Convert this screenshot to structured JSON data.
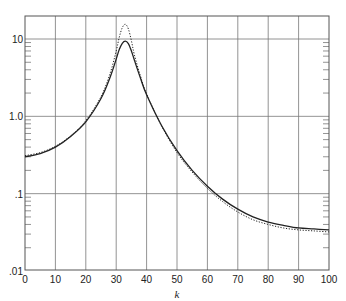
{
  "chart_data": {
    "type": "line",
    "title": "",
    "xlabel": "k",
    "ylabel": "",
    "xlim": [
      0,
      100
    ],
    "ylim": [
      0.01,
      20
    ],
    "yscale": "log",
    "grid": true,
    "legend": null,
    "x_ticks": [
      0,
      10,
      20,
      30,
      40,
      50,
      60,
      70,
      80,
      90,
      100
    ],
    "x_tick_labels": [
      "0",
      "10",
      "20",
      "30",
      "40",
      "50",
      "60",
      "70",
      "80",
      "90",
      "100"
    ],
    "y_ticks": [
      0.01,
      0.1,
      1.0,
      10
    ],
    "y_tick_labels": [
      ".01",
      ".1",
      "1.0",
      "10"
    ],
    "series": [
      {
        "name": "solid",
        "style": "solid",
        "x": [
          0,
          5,
          10,
          15,
          20,
          25,
          28,
          30,
          31,
          32,
          33,
          34,
          35,
          36,
          38,
          40,
          45,
          50,
          55,
          60,
          65,
          70,
          75,
          80,
          85,
          90,
          95,
          100
        ],
        "values": [
          0.3,
          0.33,
          0.4,
          0.55,
          0.85,
          1.7,
          3.2,
          5.5,
          7.3,
          8.8,
          9.4,
          8.7,
          7.0,
          5.3,
          3.1,
          1.9,
          0.75,
          0.36,
          0.2,
          0.125,
          0.085,
          0.063,
          0.05,
          0.043,
          0.039,
          0.036,
          0.035,
          0.034
        ]
      },
      {
        "name": "dotted",
        "style": "dotted",
        "x": [
          0,
          5,
          10,
          15,
          20,
          25,
          28,
          30,
          31,
          32,
          33,
          34,
          35,
          36,
          38,
          40,
          45,
          50,
          55,
          60,
          65,
          70,
          75,
          80,
          85,
          90,
          95,
          100
        ],
        "values": [
          0.31,
          0.34,
          0.41,
          0.56,
          0.88,
          1.8,
          3.6,
          7.0,
          10.5,
          14.0,
          15.5,
          13.5,
          9.5,
          6.2,
          3.3,
          1.95,
          0.74,
          0.34,
          0.19,
          0.117,
          0.079,
          0.058,
          0.046,
          0.04,
          0.036,
          0.034,
          0.033,
          0.032
        ]
      }
    ]
  }
}
